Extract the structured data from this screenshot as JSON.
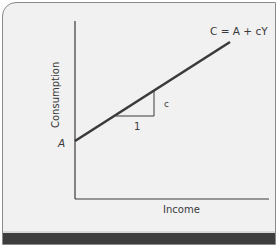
{
  "diagram": {
    "type": "consumption-function",
    "equation_label": "C = A + cY",
    "y_axis_label": "Consumption",
    "x_axis_label": "Income",
    "intercept_label": "A",
    "slope_rise_label": "c",
    "slope_run_label": "1"
  },
  "colors": {
    "background": "#f1f1f1",
    "line": "#3a3a3a",
    "bottom_bar": "#3d3d3d"
  }
}
